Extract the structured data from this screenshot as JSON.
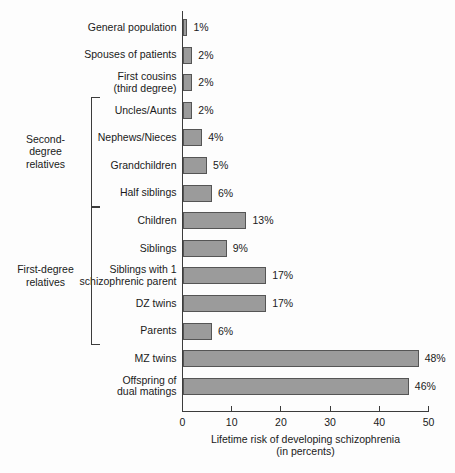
{
  "chart_data": {
    "type": "bar",
    "orientation": "horizontal",
    "title": "",
    "xlabel": "Lifetime risk of developing schizophrenia\n(in percents)",
    "ylabel": "",
    "xlim": [
      0,
      50
    ],
    "xticks": [
      "0",
      "10",
      "20",
      "30",
      "40",
      "50"
    ],
    "grid": false,
    "legend": null,
    "categories": [
      "General population",
      "Spouses of patients",
      "First cousins\n(third degree)",
      "Uncles/Aunts",
      "Nephews/Nieces",
      "Grandchildren",
      "Half siblings",
      "Children",
      "Siblings",
      "Siblings with 1\nschizophrenic parent",
      "DZ twins",
      "Parents",
      "MZ twins",
      "Offspring of\ndual matings"
    ],
    "values": [
      1,
      2,
      2,
      2,
      4,
      5,
      6,
      13,
      9,
      17,
      17,
      6,
      48,
      46
    ],
    "value_labels": [
      "1%",
      "2%",
      "2%",
      "2%",
      "4%",
      "5%",
      "6%",
      "13%",
      "9%",
      "17%",
      "17%",
      "6%",
      "48%",
      "46%"
    ],
    "groups": [
      {
        "label": "Second-\ndegree\nrelatives",
        "first_index": 3,
        "last_index": 6
      },
      {
        "label": "First-degree\nrelatives",
        "first_index": 7,
        "last_index": 11
      }
    ],
    "colors": {
      "bar_fill": "#9b9b9b",
      "bar_stroke": "#555555",
      "axis": "#3c3c3c",
      "text": "#1a1a1a",
      "background": "#fdfdfd"
    }
  }
}
